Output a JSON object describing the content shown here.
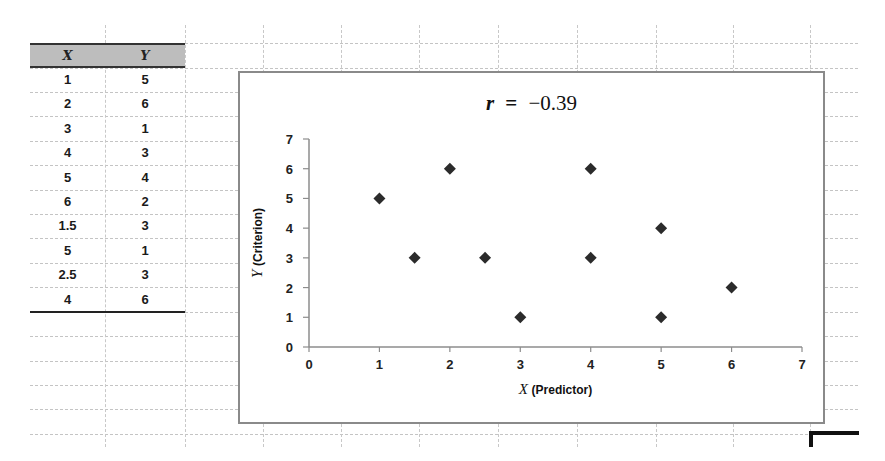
{
  "spreadsheet": {
    "table": {
      "headers": [
        "X",
        "Y"
      ],
      "rows": [
        [
          "1",
          "5"
        ],
        [
          "2",
          "6"
        ],
        [
          "3",
          "1"
        ],
        [
          "4",
          "3"
        ],
        [
          "5",
          "4"
        ],
        [
          "6",
          "2"
        ],
        [
          "1.5",
          "3"
        ],
        [
          "5",
          "1"
        ],
        [
          "2.5",
          "3"
        ],
        [
          "4",
          "6"
        ]
      ]
    }
  },
  "chart": {
    "title_var": "r",
    "title_eq": "=",
    "title_value": "−0.39",
    "xlabel_var": "X",
    "xlabel_rest": "(Predictor)",
    "ylabel_var": "Y",
    "ylabel_rest": "(Criterion)",
    "marker_color": "#2b2b2b",
    "axis_color": "#8c8c8c"
  },
  "chart_data": {
    "type": "scatter",
    "title": "r = −0.39",
    "xlabel": "X (Predictor)",
    "ylabel": "Y (Criterion)",
    "xlim": [
      0,
      7
    ],
    "ylim": [
      0,
      7
    ],
    "xticks": [
      0,
      1,
      2,
      3,
      4,
      5,
      6,
      7
    ],
    "yticks": [
      0,
      1,
      2,
      3,
      4,
      5,
      6,
      7
    ],
    "grid": false,
    "legend": null,
    "marker": "diamond",
    "series": [
      {
        "name": "Y",
        "x": [
          1,
          2,
          3,
          4,
          5,
          6,
          1.5,
          5,
          2.5,
          4
        ],
        "y": [
          5,
          6,
          1,
          3,
          4,
          2,
          3,
          1,
          3,
          6
        ]
      }
    ]
  }
}
